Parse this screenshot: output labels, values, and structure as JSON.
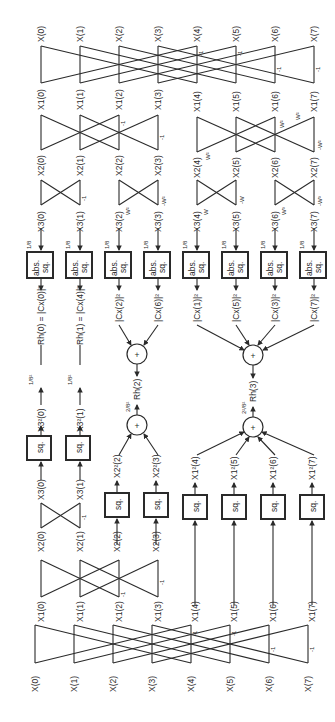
{
  "diagram": {
    "orientation": "rotated-ccw",
    "inputs": [
      "X(0)",
      "X(1)",
      "X(2)",
      "X(3)",
      "X(4)",
      "X(5)",
      "X(6)",
      "X(7)"
    ],
    "stage_top": {
      "outputs_stage1": [
        "X1(0)",
        "X1(1)",
        "X1(2)",
        "X1(3)",
        "X1(4)",
        "X1(5)",
        "X1(6)",
        "X1(7)"
      ],
      "outputs_stage2": [
        "X2(0)",
        "X2(1)",
        "X2(2)",
        "X2(3)",
        "X2(4)",
        "X2(5)",
        "X2(6)",
        "X2(7)"
      ],
      "outputs_stage3": [
        "X3(0)",
        "X3(1)",
        "X3(2)",
        "X3(3)",
        "X3(4)",
        "X3(5)",
        "X3(6)",
        "X3(7)"
      ],
      "stage1_multipliers": [
        "",
        "",
        "",
        "",
        "-1",
        "-1",
        "-1",
        "-1"
      ],
      "stage2_multipliers": [
        "",
        "",
        "-1",
        "-1",
        "W²",
        "W²",
        "-W²",
        "-W²"
      ],
      "stage3_multipliers": [
        "",
        "-1",
        "W²",
        "-W²",
        "W",
        "-W",
        "W³",
        "-W³"
      ],
      "abs_sq_boxes": {
        "label_line1": "abs.",
        "label_line2": "sq.",
        "scale": "1/8",
        "count": 8
      },
      "abs_sq_outputs": [
        "Rh(0) = |Cx(0)|²",
        "Rh(1) = |Cx(4)|²",
        "|Cx(2)|²",
        "|Cx(6)|²",
        "|Cx(1)|²",
        "|Cx(5)|²",
        "|Cx(3)|²",
        "|Cx(7)|²"
      ]
    },
    "stage_bottom": {
      "outputs_stage1": [
        "X1(0)",
        "X1(1)",
        "X1(2)",
        "X1(3)",
        "X1(4)",
        "X1(5)",
        "X1(6)",
        "X1(7)"
      ],
      "outputs_stage2": [
        "X2(0)",
        "X2(1)",
        "X2(2)",
        "X2(3)"
      ],
      "outputs_stage3": [
        "X3(0)",
        "X3(1)"
      ],
      "stage1_multipliers": [
        "",
        "",
        "",
        "",
        "-1",
        "-1",
        "-1",
        "-1"
      ],
      "stage2_multipliers": [
        "",
        "",
        "-1",
        "-1"
      ],
      "stage3_multipliers": [
        "",
        "-1"
      ],
      "sq_box_label": "sq.",
      "sq_outputs": [
        "X3²(0)",
        "X3²(1)",
        "X2²(2)",
        "X2²(3)",
        "X1²(4)",
        "X1²(5)",
        "X1²(6)",
        "X1²(7)"
      ],
      "scales": [
        "1/8²",
        "1/8²",
        "2/8²",
        "2²/8²"
      ]
    },
    "sum_nodes": [
      {
        "symbol": "+",
        "output": "Rh(2)",
        "inputs": [
          "|Cx(2)|²",
          "|Cx(6)|²"
        ]
      },
      {
        "symbol": "+",
        "output": "Rh(3)",
        "inputs": [
          "|Cx(1)|²",
          "|Cx(5)|²",
          "|Cx(3)|²",
          "|Cx(7)|²"
        ]
      },
      {
        "symbol": "+",
        "output": "Rh(2)",
        "inputs": [
          "X2²(2)",
          "X2²(3)"
        ],
        "scale": "2/8²"
      },
      {
        "symbol": "+",
        "output": "Rh(3)",
        "inputs": [
          "X1²(4)",
          "X1²(5)",
          "X1²(6)",
          "X1²(7)"
        ],
        "scale": "2²/8²"
      }
    ],
    "labels": {
      "top_inputs": [
        "X(0)",
        "X(1)",
        "X(2)",
        "X(3)",
        "X(4)",
        "X(5)",
        "X(6)",
        "X(7)"
      ],
      "top_x1": [
        "X1(0)",
        "X1(1)",
        "X1(2)",
        "X1(3)",
        "X1(4)",
        "X1(5)",
        "X1(6)",
        "X1(7)"
      ],
      "top_x2": [
        "X2(0)",
        "X2(1)",
        "X2(2)",
        "X2(3)",
        "X2(4)",
        "X2(5)",
        "X2(6)",
        "X2(7)"
      ],
      "top_x3": [
        "X3(0)",
        "X3(1)",
        "X3(2)",
        "X3(3)",
        "X3(4)",
        "X3(5)",
        "X3(6)",
        "X3(7)"
      ],
      "scale_1_8": "1/8",
      "abs": "abs.",
      "sq": "sq.",
      "cx": [
        "Rh(0) = |Cx(0)|²",
        "Rh(1) = |Cx(4)|²",
        "|Cx(2)|²",
        "|Cx(6)|²",
        "|Cx(1)|²",
        "|Cx(5)|²",
        "|Cx(3)|²",
        "|Cx(7)|²"
      ],
      "plus": "+",
      "rh2": "Rh(2)",
      "rh3": "Rh(3)",
      "s18sq": "1/8²",
      "s28sq": "2/8²",
      "s228sq": "2²/8²",
      "bot_x3sq": [
        "X3²(0)",
        "X3²(1)"
      ],
      "bot_x2sq": [
        "X2²(2)",
        "X2²(3)"
      ],
      "bot_x1sq": [
        "X1²(4)",
        "X1²(5)",
        "X1²(6)",
        "X1²(7)"
      ],
      "bot_x3": [
        "X3(0)",
        "X3(1)"
      ],
      "bot_x2": [
        "X2(0)",
        "X2(1)",
        "X2(2)",
        "X2(3)"
      ],
      "bot_x1": [
        "X1(0)",
        "X1(1)",
        "X1(2)",
        "X1(3)",
        "X1(4)",
        "X1(5)",
        "X1(6)",
        "X1(7)"
      ],
      "bot_inputs": [
        "X(0)",
        "X(1)",
        "X(2)",
        "X(3)",
        "X(4)",
        "X(5)",
        "X(6)",
        "X(7)"
      ],
      "neg1": "-1",
      "w": "W",
      "negw": "-W",
      "w2": "W²",
      "negw2": "-W²",
      "w3": "W³",
      "negw3": "-W³"
    }
  }
}
